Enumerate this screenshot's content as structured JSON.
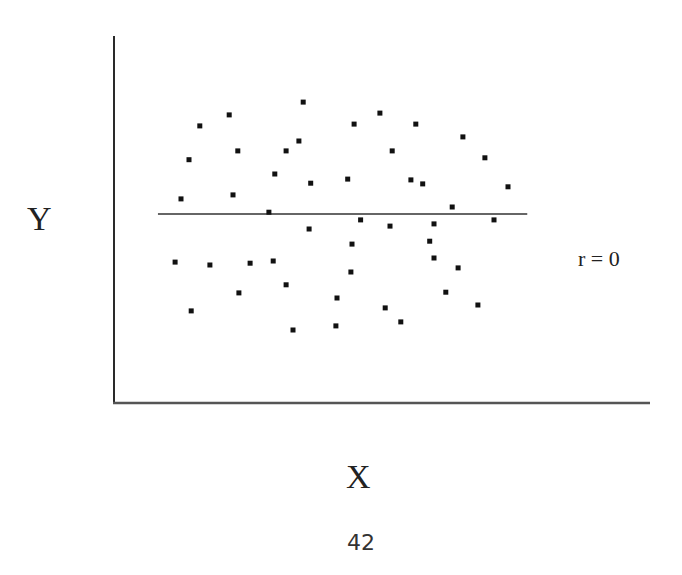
{
  "chart_data": {
    "type": "scatter",
    "title": "",
    "xlabel": "X",
    "ylabel": "Y",
    "xlim": [
      0,
      100
    ],
    "ylim": [
      0,
      100
    ],
    "grid": false,
    "legend": null,
    "ticks": {
      "x": [],
      "y": []
    },
    "annotation": "r = 0",
    "regression_line": {
      "x": [
        8.2,
        77.1
      ],
      "y": [
        51.5,
        51.5
      ],
      "note": "horizontal best-fit line, slope 0"
    },
    "series": [
      {
        "name": "points",
        "points": [
          [
            16.0,
            75.5
          ],
          [
            21.5,
            78.5
          ],
          [
            14.0,
            66.3
          ],
          [
            23.1,
            68.7
          ],
          [
            12.5,
            55.6
          ],
          [
            22.2,
            56.7
          ],
          [
            35.3,
            82.0
          ],
          [
            44.8,
            76.0
          ],
          [
            34.5,
            71.4
          ],
          [
            32.1,
            68.7
          ],
          [
            30.0,
            62.4
          ],
          [
            36.7,
            59.9
          ],
          [
            43.6,
            61.0
          ],
          [
            28.9,
            52.0
          ],
          [
            49.6,
            79.0
          ],
          [
            56.3,
            76.0
          ],
          [
            65.1,
            72.5
          ],
          [
            51.9,
            68.7
          ],
          [
            69.2,
            66.8
          ],
          [
            55.4,
            60.8
          ],
          [
            57.6,
            59.7
          ],
          [
            73.5,
            58.9
          ],
          [
            63.1,
            53.4
          ],
          [
            70.9,
            49.9
          ],
          [
            59.7,
            48.8
          ],
          [
            46.0,
            49.9
          ],
          [
            36.4,
            47.4
          ],
          [
            51.5,
            48.2
          ],
          [
            44.4,
            43.3
          ],
          [
            58.9,
            44.1
          ],
          [
            17.9,
            37.6
          ],
          [
            25.4,
            38.1
          ],
          [
            29.7,
            38.7
          ],
          [
            11.4,
            38.4
          ],
          [
            23.3,
            30.0
          ],
          [
            14.4,
            25.1
          ],
          [
            44.2,
            35.7
          ],
          [
            32.1,
            32.2
          ],
          [
            41.6,
            28.6
          ],
          [
            50.6,
            25.9
          ],
          [
            53.5,
            22.1
          ],
          [
            33.4,
            19.9
          ],
          [
            41.4,
            21.0
          ],
          [
            59.7,
            39.5
          ],
          [
            64.2,
            36.8
          ],
          [
            61.9,
            30.2
          ],
          [
            67.9,
            26.7
          ]
        ]
      }
    ]
  },
  "labels": {
    "y_axis": "Y",
    "x_axis": "X",
    "annotation": "r = 0",
    "page_number": "42"
  },
  "style": {
    "axis_color": "#2a2a2a",
    "point_color": "#111111",
    "line_color": "#333333",
    "text_color": "#222222"
  }
}
